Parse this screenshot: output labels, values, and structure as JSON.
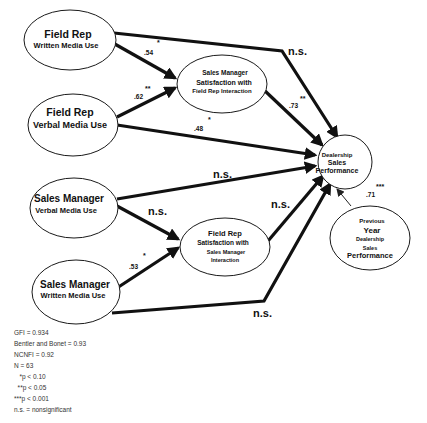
{
  "diagram": {
    "nodes": {
      "fr_written": {
        "line1": "Field Rep",
        "line2": "Written Media Use"
      },
      "fr_verbal": {
        "line1": "Field Rep",
        "line2": "Verbal Media Use"
      },
      "sm_verbal": {
        "line1": "Sales Manager",
        "line2": "Verbal Media Use"
      },
      "sm_written": {
        "line1": "Sales Manager",
        "line2": "Written Media Use"
      },
      "sm_satisfaction": {
        "line1": "Sales Manager",
        "line2": "Satisfaction with",
        "line3": "Field Rep Interaction"
      },
      "fr_satisfaction": {
        "line1": "Field Rep",
        "line2": "Satisfaction with",
        "line3": "Sales Manager",
        "line4": "Interaction"
      },
      "dealership_perf": {
        "line1": "Dealership",
        "line2": "Sales",
        "line3": "Performance"
      },
      "prev_year_perf": {
        "line1": "Previous",
        "line2": "Year",
        "line3": "Dealership",
        "line4": "Sales",
        "line5": "Performance"
      }
    },
    "edges": {
      "frw_to_dealer": {
        "coef": "n.s.",
        "sig": "*"
      },
      "frw_to_smsat": {
        "coef": ".54",
        "sig": "*"
      },
      "frv_to_smsat": {
        "coef": ".62",
        "sig": "**"
      },
      "frv_to_dealer": {
        "coef": ".48",
        "sig": "*"
      },
      "smsat_to_dealer": {
        "coef": ".73",
        "sig": "**"
      },
      "smv_to_dealer": {
        "coef": "n.s."
      },
      "smv_to_frsat": {
        "coef": "n.s."
      },
      "smw_to_frsat": {
        "coef": ".53",
        "sig": "*"
      },
      "frsat_to_dealer": {
        "coef": "n.s."
      },
      "smw_to_dealer": {
        "coef": "n.s."
      },
      "prev_to_dealer": {
        "coef": ".71",
        "sig": "***"
      }
    }
  },
  "legend": {
    "gfi": "GFI = 0.934",
    "bentler_bonet": "Bentler and Bonet = 0.93",
    "ncnfi": "NCNFI = 0.92",
    "n": "N = 63",
    "p1": "   *p < 0.10",
    "p2": "  **p < 0.05",
    "p3": "***p < 0.001",
    "ns": "n.s. = nonsignificant"
  }
}
